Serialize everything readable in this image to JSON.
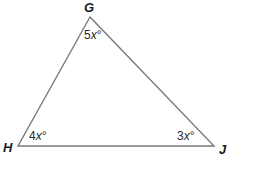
{
  "figure": {
    "type": "triangle",
    "stroke_color": "#7a7a7a",
    "vertices": [
      {
        "name": "G",
        "x": 90,
        "y": 17
      },
      {
        "name": "H",
        "x": 18,
        "y": 146
      },
      {
        "name": "J",
        "x": 214,
        "y": 146
      }
    ],
    "vertex_labels": {
      "G": "G",
      "H": "H",
      "J": "J"
    },
    "angles": {
      "G": {
        "coef": "5",
        "var": "x",
        "unit": "°"
      },
      "H": {
        "coef": "4",
        "var": "x",
        "unit": "°"
      },
      "J": {
        "coef": "3",
        "var": "x",
        "unit": "°"
      }
    }
  }
}
